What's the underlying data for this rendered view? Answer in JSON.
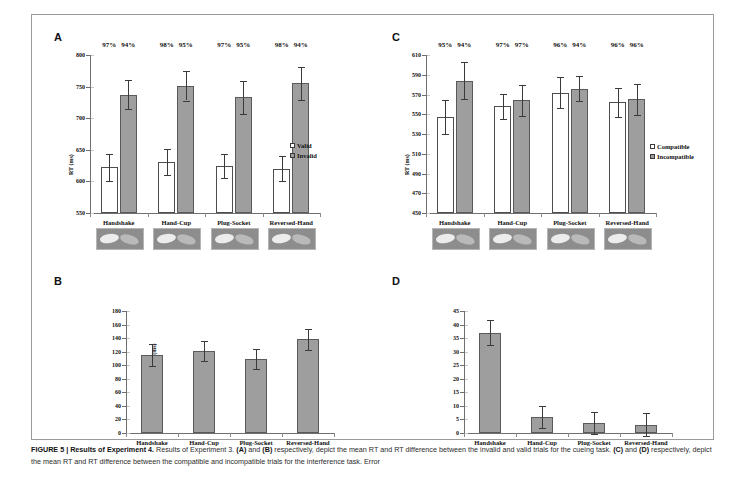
{
  "figure": {
    "caption_label": "FIGURE 5 |",
    "caption_title": "Results of Experiment 4.",
    "caption_body_1": " Results of Experiment 3. ",
    "caption_a": "(A)",
    "caption_and_1": " and ",
    "caption_b": "(B)",
    "caption_body_2": " respectively, depict the mean RT and RT difference between the invalid and valid trials for the cueing task. ",
    "caption_c": "(C)",
    "caption_and_2": " and ",
    "caption_d": "(D)",
    "caption_body_3": " respectively, depict the mean RT and RT difference between the compatible and incompatible trials for the interference task. Error"
  },
  "categories": [
    "Handshake",
    "Hand-Cup",
    "Plug-Socket",
    "Reversed-Hand"
  ],
  "panels": {
    "a": {
      "letter": "A",
      "ylabel": "RT (ms)",
      "legend": [
        "Valid",
        "Invalid"
      ]
    },
    "b": {
      "letter": "B",
      "ylabel_line1": "RT Difference",
      "ylabel_line2": "(Invalid RT - Valid) (ms)"
    },
    "c": {
      "letter": "C",
      "ylabel": "RT (ms)",
      "legend": [
        "Compatible",
        "Incompatible"
      ]
    },
    "d": {
      "letter": "D",
      "ylabel_line1": "RT Difference (Compatible RT -",
      "ylabel_line2": "Incompatible RT) (ms)"
    }
  },
  "chart_data": [
    {
      "panel": "A",
      "type": "bar",
      "title": "",
      "xlabel": "",
      "ylabel": "RT (ms)",
      "ylim": [
        550,
        800
      ],
      "yticks": [
        550,
        600,
        650,
        700,
        750,
        800
      ],
      "grid": false,
      "legend": [
        "Valid",
        "Invalid"
      ],
      "legend_position": "right",
      "categories": [
        "Handshake",
        "Hand-Cup",
        "Plug-Socket",
        "Reversed-Hand"
      ],
      "series": [
        {
          "name": "Valid",
          "values": [
            622,
            631,
            625,
            620
          ],
          "errors": [
            21,
            21,
            19,
            20
          ]
        },
        {
          "name": "Invalid",
          "values": [
            737,
            751,
            733,
            755
          ],
          "errors": [
            23,
            23,
            26,
            26
          ]
        }
      ],
      "annotations": {
        "accuracy_valid": [
          "97%",
          "98%",
          "97%",
          "98%"
        ],
        "accuracy_invalid": [
          "94%",
          "95%",
          "95%",
          "94%"
        ]
      }
    },
    {
      "panel": "B",
      "type": "bar",
      "title": "",
      "xlabel": "",
      "ylabel": "RT Difference (Invalid RT - Valid) (ms)",
      "ylim": [
        0,
        180
      ],
      "yticks": [
        0,
        20,
        40,
        60,
        80,
        100,
        120,
        140,
        160,
        180
      ],
      "grid": false,
      "categories": [
        "Handshake",
        "Hand-Cup",
        "Plug-Socket",
        "Reversed-Hand"
      ],
      "series": [
        {
          "name": "RT Difference",
          "values": [
            115,
            121,
            109,
            138
          ],
          "errors": [
            16,
            15,
            15,
            16
          ]
        }
      ]
    },
    {
      "panel": "C",
      "type": "bar",
      "title": "",
      "xlabel": "",
      "ylabel": "RT (ms)",
      "ylim": [
        450,
        610
      ],
      "yticks": [
        450,
        470,
        490,
        510,
        530,
        550,
        570,
        590,
        610
      ],
      "grid": false,
      "legend": [
        "Compatible",
        "Incompatible"
      ],
      "legend_position": "right",
      "categories": [
        "Handshake",
        "Hand-Cup",
        "Plug-Socket",
        "Reversed-Hand"
      ],
      "series": [
        {
          "name": "Compatible",
          "values": [
            547,
            558,
            572,
            562
          ],
          "errors": [
            17,
            13,
            16,
            15
          ]
        },
        {
          "name": "Incompatible",
          "values": [
            584,
            564,
            576,
            565
          ],
          "errors": [
            19,
            16,
            13,
            16
          ]
        }
      ],
      "annotations": {
        "accuracy_compatible": [
          "95%",
          "97%",
          "96%",
          "96%"
        ],
        "accuracy_incompatible": [
          "94%",
          "97%",
          "94%",
          "96%"
        ]
      }
    },
    {
      "panel": "D",
      "type": "bar",
      "title": "",
      "xlabel": "",
      "ylabel": "RT Difference (Compatible RT - Incompatible RT) (ms)",
      "ylim": [
        0,
        45
      ],
      "yticks": [
        0,
        5,
        10,
        15,
        20,
        25,
        30,
        35,
        40,
        45
      ],
      "grid": false,
      "categories": [
        "Handshake",
        "Hand-Cup",
        "Plug-Socket",
        "Reversed-Hand"
      ],
      "series": [
        {
          "name": "RT Difference",
          "values": [
            37,
            6,
            3.8,
            3
          ],
          "errors": [
            4.5,
            4,
            4,
            4.2
          ]
        }
      ]
    }
  ]
}
